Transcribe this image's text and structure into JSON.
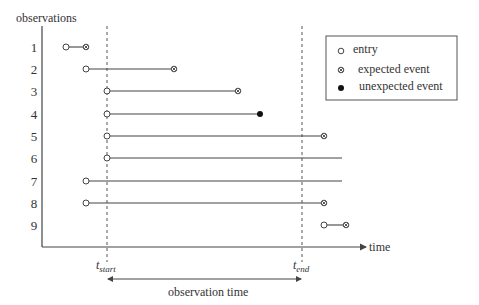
{
  "diagram": {
    "y_axis_label": "observations",
    "x_axis_label": "time",
    "t_start_label": {
      "base": "t",
      "sub": "start"
    },
    "t_end_label": {
      "base": "t",
      "sub": "end"
    },
    "span_label": "observation time",
    "legend": {
      "entry": "entry",
      "expected": "expected event",
      "unexpected": "unexpected event"
    },
    "observations": [
      {
        "id": "1",
        "start": 66,
        "end": 86,
        "end_marker": "expected",
        "entry_marker": true
      },
      {
        "id": "2",
        "start": 86,
        "end": 174,
        "end_marker": "expected",
        "entry_marker": true
      },
      {
        "id": "3",
        "start": 107,
        "end": 238,
        "end_marker": "expected",
        "entry_marker": true
      },
      {
        "id": "4",
        "start": 107,
        "end": 260,
        "end_marker": "unexpected",
        "entry_marker": true
      },
      {
        "id": "5",
        "start": 107,
        "end": 324,
        "end_marker": "expected",
        "entry_marker": true
      },
      {
        "id": "6",
        "start": 107,
        "end": 342,
        "end_marker": "none",
        "entry_marker": true
      },
      {
        "id": "7",
        "start": 86,
        "end": 342,
        "end_marker": "none",
        "entry_marker": true
      },
      {
        "id": "8",
        "start": 86,
        "end": 324,
        "end_marker": "expected",
        "entry_marker": true
      },
      {
        "id": "9",
        "start": 324,
        "end": 346,
        "end_marker": "expected",
        "entry_marker": true
      }
    ]
  }
}
